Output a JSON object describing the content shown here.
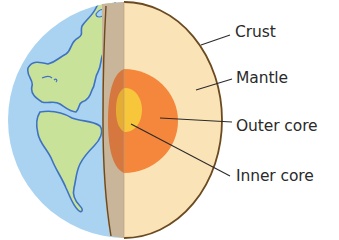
{
  "diagram": {
    "labels": [
      {
        "id": "crust",
        "text": "Crust"
      },
      {
        "id": "mantle",
        "text": "Mantle"
      },
      {
        "id": "outer_core",
        "text": "Outer core"
      },
      {
        "id": "inner_core",
        "text": "Inner core"
      }
    ],
    "colors": {
      "ocean": "#a9d3f1",
      "land": "#c9e29a",
      "coastline": "#3f73c2",
      "crust_face": "#c9b59a",
      "crust_outline": "#6b4a1f",
      "mantle": "#fbe3b8",
      "outer_core": "#f4873c",
      "outer_core_shadow": "#d5773e",
      "inner_core": "#f7c63a",
      "leader_line": "#2b2b2b",
      "label_text": "#2a2a2a"
    }
  }
}
